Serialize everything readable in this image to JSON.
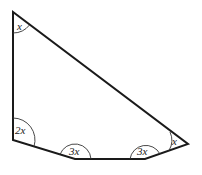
{
  "diagram": {
    "type": "pentagon-angles",
    "vertices": [
      {
        "name": "top",
        "x": 13,
        "y": 12,
        "angle_label": "x"
      },
      {
        "name": "bottom-left",
        "x": 13,
        "y": 140,
        "angle_label": "2x"
      },
      {
        "name": "bottom-mid-left",
        "x": 75,
        "y": 159,
        "angle_label": "3x"
      },
      {
        "name": "bottom-mid-right",
        "x": 145,
        "y": 159,
        "angle_label": "3x"
      },
      {
        "name": "right",
        "x": 188,
        "y": 144,
        "angle_label": "x"
      }
    ],
    "labels": {
      "top": "x",
      "bottom_left": "2x",
      "bottom_mid_left": "3x",
      "bottom_mid_right": "3x",
      "right": "x"
    },
    "colors": {
      "stroke": "#1a1a1a",
      "background": "#ffffff"
    }
  }
}
